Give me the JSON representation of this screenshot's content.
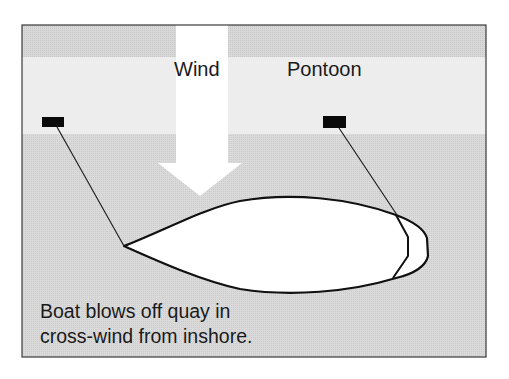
{
  "diagram": {
    "labels": {
      "wind": "Wind",
      "pontoon": "Pontoon"
    },
    "caption": {
      "line1": "Boat blows off quay in",
      "line2": "cross-wind from inshore."
    },
    "elements": {
      "wind_arrow": "down-arrow-icon",
      "bollards": [
        "left-bollard",
        "right-bollard"
      ],
      "boat": "boat-hull-outline",
      "mooring_lines": [
        "bow-line",
        "stern-line"
      ]
    },
    "colors": {
      "frame": "#3a3a3a",
      "top_band": "#d2d2d2",
      "pontoon_band": "#ededed",
      "water": "#d4d4d4",
      "arrow": "#ffffff",
      "hull_fill": "#ffffff",
      "lines": "#111111"
    }
  }
}
